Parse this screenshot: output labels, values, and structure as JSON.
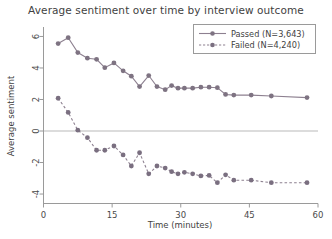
{
  "chart_data": {
    "type": "line",
    "title": "Average sentiment over time by interview outcome",
    "xlabel": "Time (minutes)",
    "ylabel": "Average sentiment",
    "xlim": [
      0,
      60
    ],
    "ylim": [
      -4.6,
      6.6
    ],
    "xticks": [
      0,
      15,
      30,
      45,
      60
    ],
    "yticks": [
      6,
      4,
      2,
      0,
      -2,
      -4
    ],
    "grid": false,
    "zero_line": true,
    "legend_position": "top-right",
    "series": [
      {
        "name": "Passed (N=3,643)",
        "label": "Passed",
        "n": "3,643",
        "linestyle": "solid",
        "marker": "circle",
        "color": "#8d8090",
        "x": [
          3.2,
          5.4,
          7.5,
          9.6,
          11.6,
          13.4,
          15.4,
          17.4,
          19.2,
          21.0,
          23.0,
          24.8,
          26.6,
          28.0,
          29.4,
          30.8,
          32.6,
          34.4,
          36.2,
          38.0,
          39.8,
          41.6,
          45.4,
          49.8,
          57.6
        ],
        "y": [
          5.55,
          5.92,
          4.98,
          4.62,
          4.55,
          4.02,
          4.32,
          3.82,
          3.48,
          2.82,
          3.52,
          2.82,
          2.62,
          2.88,
          2.72,
          2.72,
          2.72,
          2.78,
          2.78,
          2.75,
          2.32,
          2.28,
          2.28,
          2.22,
          2.12
        ]
      },
      {
        "name": "Failed (N=4,240)",
        "label": "Failed",
        "n": "4,240",
        "linestyle": "dashed",
        "marker": "circle",
        "color": "#8d8090",
        "x": [
          3.2,
          5.4,
          7.5,
          9.6,
          11.6,
          13.4,
          15.4,
          17.4,
          19.2,
          21.0,
          23.0,
          24.8,
          26.6,
          28.0,
          29.4,
          30.8,
          32.6,
          34.4,
          36.2,
          38.0,
          39.8,
          41.6,
          45.4,
          49.8,
          57.6
        ],
        "y": [
          2.08,
          1.18,
          0.05,
          -0.42,
          -1.22,
          -1.22,
          -0.95,
          -1.52,
          -2.22,
          -1.38,
          -2.72,
          -2.22,
          -2.35,
          -2.58,
          -2.72,
          -2.62,
          -2.72,
          -2.85,
          -2.82,
          -3.28,
          -2.78,
          -3.12,
          -3.12,
          -3.28,
          -3.28
        ]
      }
    ]
  },
  "legend": {
    "entries": [
      {
        "label": "Passed (N=3,643)",
        "style": "solid"
      },
      {
        "label": "Failed  (N=4,240)",
        "style": "dashed"
      }
    ]
  }
}
